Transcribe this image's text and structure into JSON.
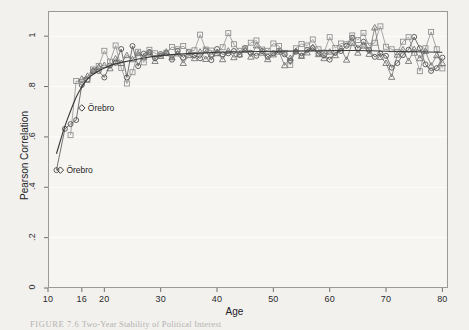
{
  "figure": {
    "caption_prefix": "FIGURE 7.6",
    "caption_text": "Two-Year Stability of Political Interest"
  },
  "annotations": [
    {
      "name": "orebro-upper",
      "label": "Örebro",
      "x": 16.0,
      "y": 0.715
    },
    {
      "name": "orebro-lower",
      "label": "Örebro",
      "x": 12.2,
      "y": 0.468
    }
  ],
  "chart_data": {
    "type": "scatter",
    "title": "Two-Year Stability of Political Interest",
    "xlabel": "Age",
    "ylabel": "Pearson Correlation",
    "xlim": [
      10,
      81
    ],
    "ylim": [
      0,
      1.1
    ],
    "xticks": [
      10,
      16,
      20,
      30,
      40,
      50,
      60,
      70,
      80
    ],
    "xtick_labels": [
      "10",
      "16",
      "20",
      "30",
      "40",
      "50",
      "60",
      "70",
      "80"
    ],
    "yticks": [
      0,
      0.2,
      0.4,
      0.6,
      0.8,
      1.0
    ],
    "ytick_labels": [
      "0",
      ".2",
      ".4",
      ".6",
      ".8",
      "1"
    ],
    "grid": true,
    "grid_axis": "y",
    "legend": "none",
    "marker_types": [
      "circle",
      "square",
      "triangle"
    ],
    "series": [
      {
        "name": "panel-circles",
        "marker": "circle",
        "color": "#4a4a4a",
        "line": true,
        "x": [
          11.5,
          13,
          14,
          15,
          16,
          17,
          18,
          19,
          20,
          21,
          22,
          23,
          24,
          25,
          26,
          27,
          28,
          29,
          30,
          31,
          32,
          33,
          34,
          35,
          36,
          37,
          38,
          39,
          40,
          41,
          42,
          43,
          44,
          45,
          46,
          47,
          48,
          49,
          50,
          51,
          52,
          53,
          54,
          55,
          56,
          57,
          58,
          59,
          60,
          61,
          62,
          63,
          64,
          65,
          66,
          67,
          68,
          69,
          70,
          71,
          72,
          73,
          74,
          75,
          76,
          77,
          78,
          79,
          80
        ],
        "y": [
          0.468,
          0.632,
          0.651,
          0.667,
          0.806,
          0.828,
          0.861,
          0.862,
          0.836,
          0.884,
          0.894,
          0.949,
          0.836,
          0.961,
          0.881,
          0.931,
          0.937,
          0.912,
          0.929,
          0.932,
          0.907,
          0.941,
          0.915,
          0.937,
          0.925,
          0.912,
          0.944,
          0.905,
          0.949,
          0.928,
          0.932,
          0.941,
          0.926,
          0.953,
          0.934,
          0.922,
          0.941,
          0.918,
          0.932,
          0.943,
          0.928,
          0.902,
          0.938,
          0.922,
          0.946,
          0.953,
          0.931,
          0.924,
          0.907,
          0.934,
          0.941,
          0.962,
          0.994,
          0.952,
          0.978,
          0.945,
          0.918,
          0.931,
          0.922,
          0.875,
          0.893,
          0.925,
          0.946,
          0.997,
          0.952,
          0.888,
          0.862,
          0.873,
          0.915
        ]
      },
      {
        "name": "panel-squares",
        "marker": "square",
        "color": "#8c8c8c",
        "line": true,
        "x": [
          14,
          15,
          16,
          17,
          18,
          19,
          20,
          21,
          22,
          23,
          24,
          25,
          26,
          27,
          28,
          29,
          30,
          31,
          32,
          33,
          34,
          35,
          36,
          37,
          38,
          39,
          40,
          41,
          42,
          43,
          44,
          45,
          46,
          47,
          48,
          49,
          50,
          51,
          52,
          53,
          54,
          55,
          56,
          57,
          58,
          59,
          60,
          61,
          62,
          63,
          64,
          65,
          66,
          67,
          68,
          69,
          70,
          71,
          72,
          73,
          74,
          75,
          76,
          77,
          78,
          79,
          80
        ],
        "y": [
          0.607,
          0.822,
          0.818,
          0.826,
          0.868,
          0.882,
          0.942,
          0.899,
          0.963,
          0.874,
          0.812,
          0.857,
          0.938,
          0.896,
          0.946,
          0.932,
          0.921,
          0.934,
          0.957,
          0.948,
          0.961,
          0.938,
          0.944,
          1.006,
          0.947,
          0.943,
          0.932,
          0.956,
          1.012,
          0.968,
          0.942,
          0.951,
          0.974,
          0.983,
          0.947,
          0.942,
          0.971,
          0.961,
          0.934,
          0.886,
          0.952,
          0.969,
          0.963,
          0.987,
          0.948,
          0.935,
          0.996,
          0.953,
          0.971,
          0.968,
          1.003,
          0.985,
          1.013,
          0.962,
          0.974,
          1.039,
          0.958,
          0.948,
          0.937,
          0.978,
          0.996,
          0.934,
          0.861,
          0.952,
          1.017,
          0.948,
          0.872
        ]
      },
      {
        "name": "panel-triangles",
        "marker": "triangle",
        "color": "#6e6e6e",
        "line": true,
        "x": [
          16,
          17,
          18,
          19,
          20,
          21,
          22,
          23,
          24,
          25,
          26,
          27,
          28,
          29,
          30,
          31,
          32,
          33,
          34,
          35,
          36,
          37,
          38,
          39,
          40,
          41,
          42,
          43,
          44,
          45,
          46,
          47,
          48,
          49,
          50,
          51,
          52,
          53,
          54,
          55,
          56,
          57,
          58,
          59,
          60,
          61,
          62,
          63,
          64,
          65,
          66,
          67,
          68,
          69,
          70,
          71,
          72,
          73,
          74,
          75,
          76,
          77,
          78,
          79,
          80
        ],
        "y": [
          0.831,
          0.842,
          0.864,
          0.877,
          0.885,
          0.872,
          0.911,
          0.893,
          0.924,
          0.908,
          0.932,
          0.918,
          0.934,
          0.901,
          0.922,
          0.938,
          0.916,
          0.931,
          0.893,
          0.924,
          0.912,
          0.938,
          0.909,
          0.928,
          0.933,
          0.908,
          0.942,
          0.916,
          0.927,
          0.945,
          0.918,
          0.963,
          0.934,
          0.908,
          0.927,
          0.938,
          0.884,
          0.913,
          0.941,
          0.921,
          0.935,
          0.956,
          0.928,
          0.912,
          0.938,
          0.924,
          0.951,
          0.906,
          0.973,
          0.934,
          0.962,
          0.929,
          1.034,
          0.917,
          0.893,
          0.838,
          0.926,
          0.947,
          0.901,
          0.948,
          0.912,
          0.941,
          0.883,
          0.924,
          0.893
        ]
      }
    ],
    "trend_lines": [
      {
        "name": "smooth-dark",
        "color": "#3a3a3a",
        "x": [
          11.5,
          13,
          14,
          15,
          16,
          17,
          18,
          20,
          22,
          25,
          28,
          32,
          36,
          40,
          45,
          50,
          55,
          60,
          65,
          70,
          75,
          80
        ],
        "y": [
          0.533,
          0.645,
          0.702,
          0.761,
          0.798,
          0.833,
          0.849,
          0.875,
          0.891,
          0.905,
          0.918,
          0.928,
          0.932,
          0.936,
          0.938,
          0.94,
          0.941,
          0.942,
          0.944,
          0.94,
          0.938,
          0.936
        ]
      }
    ]
  }
}
